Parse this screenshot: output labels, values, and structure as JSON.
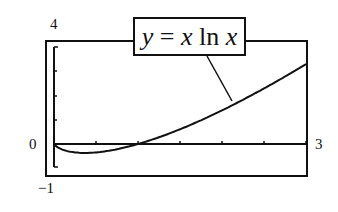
{
  "chart_data": {
    "type": "line",
    "title": "y = x ln x",
    "function": "y = x ln x",
    "xlabel": "",
    "ylabel": "",
    "xlim": [
      0,
      3
    ],
    "ylim": [
      -1,
      4
    ],
    "x_tick_labels": [
      "0",
      "3"
    ],
    "y_tick_labels": [
      "4",
      "0",
      "-1"
    ],
    "grid": false,
    "legend_position": "top-center (callout box with leader line to curve)",
    "series": [
      {
        "name": "y = x ln x",
        "x": [
          0,
          0.1,
          0.2,
          0.37,
          0.5,
          0.75,
          1.0,
          1.25,
          1.5,
          1.75,
          2.0,
          2.25,
          2.5,
          2.75,
          3.0
        ],
        "values": [
          0,
          -0.23,
          -0.32,
          -0.37,
          -0.35,
          -0.22,
          0,
          0.28,
          0.61,
          0.98,
          1.39,
          1.82,
          2.29,
          2.78,
          3.3
        ]
      }
    ]
  },
  "labels": {
    "y_max": "4",
    "y_zero": "0",
    "y_min": "−1",
    "x_max": "3",
    "eq_y": "y",
    "eq_eq": " = ",
    "eq_x1": "x",
    "eq_ln": " ln ",
    "eq_x2": "x"
  }
}
